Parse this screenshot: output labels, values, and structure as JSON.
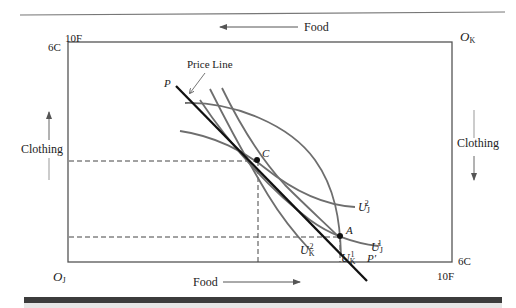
{
  "figure": {
    "title_top_axis": "Food",
    "bottom_axis": "Food",
    "left_axis": "Clothing",
    "right_axis": "Clothing",
    "origin_james": {
      "main": "O",
      "sub": "J"
    },
    "origin_karen": {
      "main": "O",
      "sub": "K"
    },
    "top_left_food": "10F",
    "top_left_clothing": "6C",
    "bottom_right_food": "10F",
    "bottom_right_clothing": "6C",
    "price_line_label": "Price Line",
    "price_start": "P",
    "price_end": "P′",
    "point_c": "C",
    "point_a": "A",
    "u_j2": {
      "main": "U",
      "sub": "J",
      "sup": "2"
    },
    "u_j1": {
      "main": "U",
      "sub": "J",
      "sup": "1"
    },
    "u_k2": {
      "main": "U",
      "sub": "K",
      "sup": "2"
    },
    "u_k1": {
      "main": "U",
      "sub": "K",
      "sup": "1"
    }
  },
  "colors": {
    "box": "#555555",
    "price_line": "#111111",
    "indifference_curves": "#6e6e6e",
    "dashed_guides": "#444444",
    "rule": "#777777"
  }
}
